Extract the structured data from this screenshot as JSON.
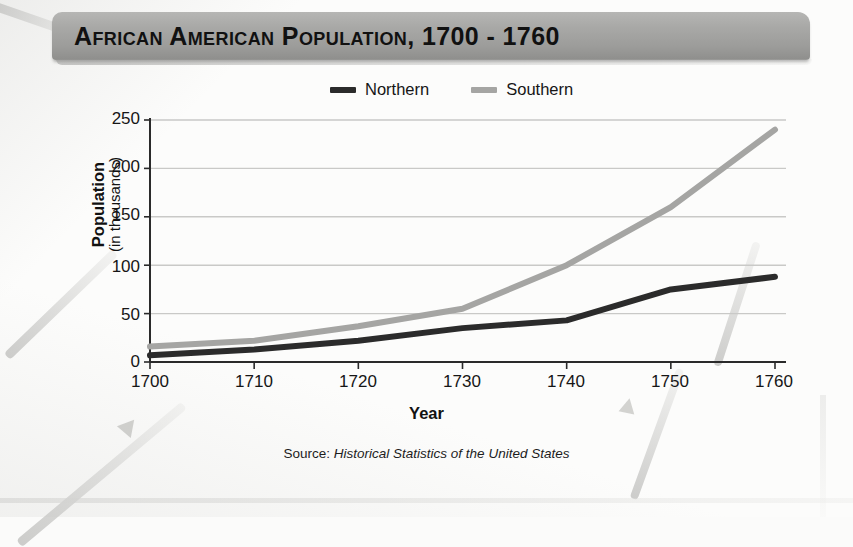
{
  "title": "African American Population, 1700 - 1760",
  "legend": {
    "position": "top-center",
    "items": [
      {
        "label": "Northern",
        "color": "#2b2b2b"
      },
      {
        "label": "Southern",
        "color": "#a5a5a3"
      }
    ]
  },
  "axes": {
    "y_title_main": "Population",
    "y_title_sub": "(in thousands)",
    "x_title": "Year",
    "y_ticks": [
      "250",
      "200",
      "150",
      "100",
      "50",
      "0"
    ],
    "x_ticks": [
      "1700",
      "1710",
      "1720",
      "1730",
      "1740",
      "1750",
      "1760"
    ]
  },
  "source": {
    "prefix": "Source: ",
    "work": "Historical Statistics of the United States"
  },
  "chart_data": {
    "type": "line",
    "title": "African American Population, 1700 - 1760",
    "xlabel": "Year",
    "ylabel": "Population (in thousands)",
    "x": [
      1700,
      1710,
      1720,
      1730,
      1740,
      1750,
      1760
    ],
    "series": [
      {
        "name": "Northern",
        "color": "#2b2b2b",
        "values": [
          7,
          13,
          22,
          35,
          43,
          75,
          88
        ]
      },
      {
        "name": "Southern",
        "color": "#a5a5a3",
        "values": [
          16,
          22,
          37,
          55,
          100,
          160,
          240
        ]
      }
    ],
    "xlim": [
      1700,
      1760
    ],
    "ylim": [
      0,
      250
    ],
    "ytick_values": [
      0,
      50,
      100,
      150,
      200,
      250
    ],
    "grid": "horizontal",
    "legend_position": "top-center"
  }
}
